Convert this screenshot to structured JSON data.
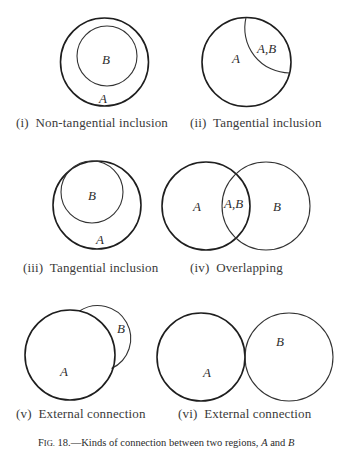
{
  "figure": {
    "number_prefix_F": "F",
    "number_prefix_rest": "IG.",
    "number": " 18.",
    "caption_text": "—Kinds of connection between two regions, ",
    "caption_A": "A",
    "caption_and": " and ",
    "caption_B": "B"
  },
  "panels": [
    {
      "id": "i",
      "caption": "(i)  Non-tangential inclusion",
      "labels": [
        "B",
        "A"
      ],
      "relation": "non-tangential inclusion"
    },
    {
      "id": "ii",
      "caption": "(ii)  Tangential inclusion",
      "labels": [
        "A",
        "A,B"
      ],
      "relation": "tangential inclusion"
    },
    {
      "id": "iii",
      "caption": "(iii)  Tangential inclusion",
      "labels": [
        "B",
        "A"
      ],
      "relation": "tangential inclusion"
    },
    {
      "id": "iv",
      "caption": "(iv)  Overlapping",
      "labels": [
        "A",
        "A,B",
        "B"
      ],
      "relation": "overlapping"
    },
    {
      "id": "v",
      "caption": "(v)  External connection",
      "labels": [
        "A",
        "B"
      ],
      "relation": "external connection"
    },
    {
      "id": "vi",
      "caption": "(vi)  External connection",
      "labels": [
        "A",
        "B"
      ],
      "relation": "external connection"
    }
  ],
  "colors": {
    "stroke": "#1e1e1e",
    "text": "#2a2a2a",
    "background": "#ffffff"
  }
}
